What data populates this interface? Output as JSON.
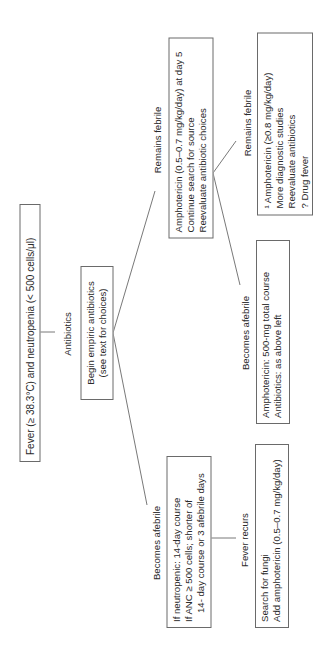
{
  "diagram": {
    "type": "flowchart",
    "orientation": "rotated-90-ccw",
    "root": {
      "text": "Fever (≥ 38.3°C) and neutropenia (< 500 cells/μl)"
    },
    "edge_antibiotics": "Antibiotics",
    "empiric": {
      "lines": [
        "Begin empiric antibiotics",
        "(see text for choices)"
      ]
    },
    "edge_remains_febrile_1": "Remains febrile",
    "remains_febrile_box": {
      "lines": [
        "Amphotericin (0.5–0.7 mg/kg/day) at day 5",
        "Continue search for source",
        "Reevaluate antibiotic choices"
      ]
    },
    "edge_becomes_afebrile_1": "Becomes afebrile",
    "afebrile_box": {
      "lines": [
        "If neutropenic: 14-day course",
        "If ANC ≥ 500 cells; shorter of",
        "14- day course or 3 afebrile days"
      ]
    },
    "edge_fever_recurs": "Fever recurs",
    "fever_recurs_box": {
      "lines": [
        "Search for fungi",
        "Add amphotericin (0.5–0.7 mg/kg/day)"
      ]
    },
    "edge_remains_febrile_2": "Remains febrile",
    "remains_febrile_2_box": {
      "lines": [
        "¹ Amphotericin (≥0.8 mg/kg/day)",
        "More diagnostic studies",
        "Reevaluate antibiotics",
        "? Drug fever"
      ]
    },
    "edge_becomes_afebrile_2": "Becomes afebrile",
    "afebrile_2_box": {
      "lines": [
        "Amphotericin: 500-mg total course",
        "Antibiotics: as above left"
      ]
    },
    "colors": {
      "line": "#555555",
      "box_border": "#6a6a6a",
      "text": "#2a2a2a",
      "background": "#ffffff"
    }
  }
}
